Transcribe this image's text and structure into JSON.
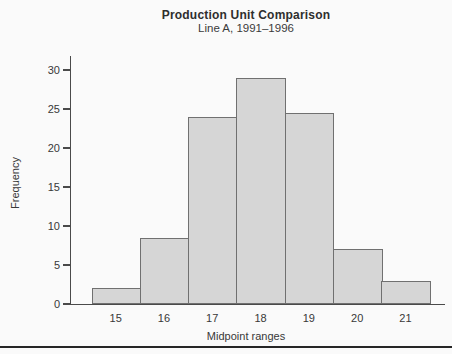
{
  "chart_data": {
    "type": "bar",
    "title": "Production Unit Comparison",
    "subtitle": "Line A, 1991–1996",
    "xlabel": "Midpoint ranges",
    "ylabel": "Frequency",
    "categories": [
      "15",
      "16",
      "17",
      "18",
      "19",
      "20",
      "21"
    ],
    "values": [
      2,
      8.5,
      24,
      29,
      24.5,
      7,
      3
    ],
    "ylim": [
      0,
      30
    ],
    "yticks": [
      0,
      5,
      10,
      15,
      20,
      25,
      30
    ],
    "grid": false,
    "legend": "none",
    "bar_fill": "#d6d6d6",
    "bar_border": "#707070",
    "axis_color": "#4a4a4a",
    "text_color": "#383838"
  }
}
